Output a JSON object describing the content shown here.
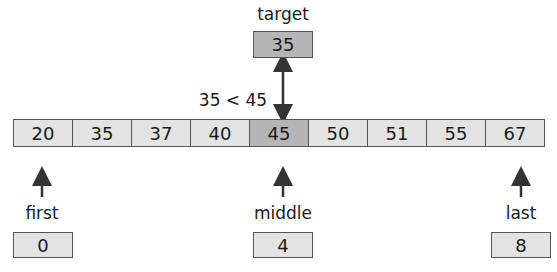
{
  "target": {
    "label": "target",
    "value": "35"
  },
  "comparison": "35 < 45",
  "array": {
    "values": [
      "20",
      "35",
      "37",
      "40",
      "45",
      "50",
      "51",
      "55",
      "67"
    ],
    "highlighted_index": 4
  },
  "pointers": [
    {
      "label": "first",
      "value": "0"
    },
    {
      "label": "middle",
      "value": "4"
    },
    {
      "label": "last",
      "value": "8"
    }
  ],
  "colors": {
    "cell": "#e3e3e3",
    "highlight": "#b5b5b5",
    "border": "#555555",
    "arrow": "#333333"
  }
}
